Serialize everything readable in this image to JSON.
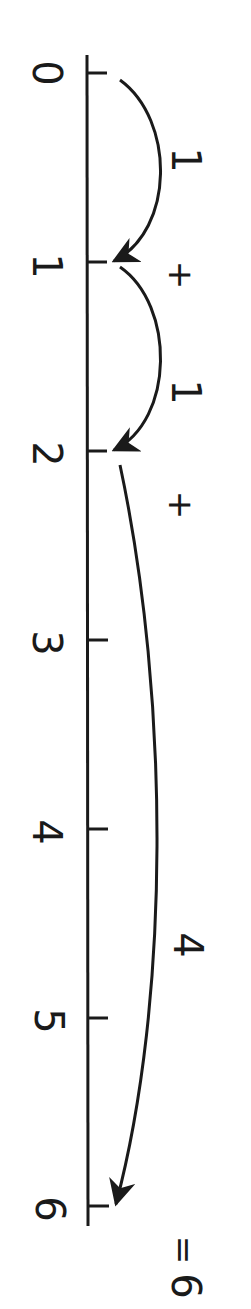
{
  "diagram": {
    "equation": "1 + 1 + 4 = 6",
    "orientation": "rotated 90deg clockwise",
    "ticks": [
      "0",
      "1",
      "2",
      "3",
      "4",
      "5",
      "6"
    ],
    "jumps": [
      {
        "from": 0,
        "to": 1,
        "label": "1"
      },
      {
        "from": 1,
        "to": 2,
        "label": "1"
      },
      {
        "from": 2,
        "to": 6,
        "label": "4"
      }
    ],
    "operators": [
      "+",
      "+"
    ],
    "result": {
      "equals": "=",
      "value": "6"
    },
    "colors": {
      "ink": "#1a1a1a",
      "background": "#ffffff"
    }
  }
}
